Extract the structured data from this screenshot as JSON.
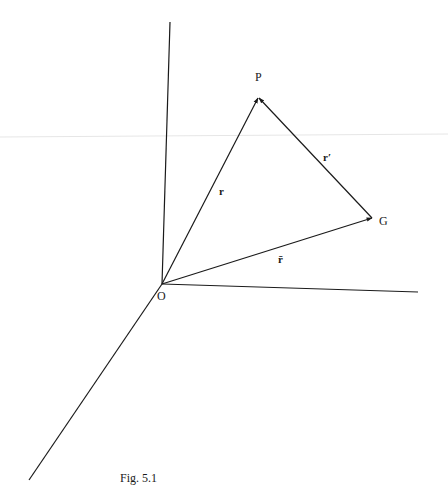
{
  "figure": {
    "caption": "Fig. 5.1",
    "points": {
      "origin": "O",
      "particle": "P",
      "centre_of_mass": "G"
    },
    "vectors": {
      "r": "r",
      "r_bar": "r̄",
      "r_prime": "r′"
    },
    "colors": {
      "ink": "#1a1a1a",
      "background": "#ffffff",
      "scan_artifact": "#e6e6e6"
    }
  }
}
